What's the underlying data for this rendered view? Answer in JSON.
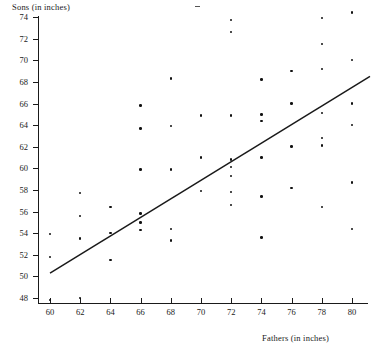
{
  "chart_data": {
    "type": "scatter",
    "title": "",
    "xlabel": "Fathers (in inches)",
    "ylabel": "Sons (in inches)",
    "xlim": [
      58.8,
      81.5
    ],
    "ylim": [
      46.6,
      74.8
    ],
    "xticks": [
      60,
      62,
      64,
      66,
      68,
      70,
      72,
      74,
      76,
      78,
      80
    ],
    "yticks": [
      48,
      50,
      52,
      54,
      56,
      58,
      60,
      62,
      64,
      66,
      68,
      70,
      72,
      74
    ],
    "grid": false,
    "legend": "none",
    "marker_color": "#111111",
    "line_color": "#1a1a1a",
    "trendline": {
      "label": "least-squares regression line",
      "x_start": 60.0,
      "y_start": 50.3,
      "x_end": 80.0,
      "y_end": 68.5
    },
    "points": [
      {
        "x": 60,
        "y": 47.8
      },
      {
        "x": 60,
        "y": 51.8
      },
      {
        "x": 60,
        "y": 53.9
      },
      {
        "x": 62,
        "y": 48.0
      },
      {
        "x": 62,
        "y": 53.5
      },
      {
        "x": 62,
        "y": 55.6
      },
      {
        "x": 62,
        "y": 57.7
      },
      {
        "x": 64,
        "y": 51.5
      },
      {
        "x": 64,
        "y": 54.0
      },
      {
        "x": 64,
        "y": 56.4
      },
      {
        "x": 66,
        "y": 54.3
      },
      {
        "x": 66,
        "y": 55.0
      },
      {
        "x": 66,
        "y": 55.8
      },
      {
        "x": 66,
        "y": 59.9
      },
      {
        "x": 66,
        "y": 63.7
      },
      {
        "x": 66,
        "y": 65.8
      },
      {
        "x": 68,
        "y": 53.3
      },
      {
        "x": 68,
        "y": 54.4
      },
      {
        "x": 68,
        "y": 59.9
      },
      {
        "x": 68,
        "y": 63.9
      },
      {
        "x": 68,
        "y": 68.3
      },
      {
        "x": 70,
        "y": 57.9
      },
      {
        "x": 70,
        "y": 61.0
      },
      {
        "x": 70,
        "y": 64.9
      },
      {
        "x": 72,
        "y": 56.6
      },
      {
        "x": 72,
        "y": 57.8
      },
      {
        "x": 72,
        "y": 59.3
      },
      {
        "x": 72,
        "y": 60.1
      },
      {
        "x": 72,
        "y": 60.8
      },
      {
        "x": 72,
        "y": 64.9
      },
      {
        "x": 72,
        "y": 72.6
      },
      {
        "x": 72,
        "y": 73.7
      },
      {
        "x": 74,
        "y": 53.6
      },
      {
        "x": 74,
        "y": 57.4
      },
      {
        "x": 74,
        "y": 61.0
      },
      {
        "x": 74,
        "y": 64.4
      },
      {
        "x": 74,
        "y": 65.0
      },
      {
        "x": 74,
        "y": 68.2
      },
      {
        "x": 76,
        "y": 58.2
      },
      {
        "x": 76,
        "y": 62.0
      },
      {
        "x": 76,
        "y": 66.0
      },
      {
        "x": 76,
        "y": 69.0
      },
      {
        "x": 78,
        "y": 56.4
      },
      {
        "x": 78,
        "y": 62.1
      },
      {
        "x": 78,
        "y": 62.8
      },
      {
        "x": 78,
        "y": 65.1
      },
      {
        "x": 78,
        "y": 69.2
      },
      {
        "x": 78,
        "y": 71.5
      },
      {
        "x": 78,
        "y": 73.9
      },
      {
        "x": 80,
        "y": 54.4
      },
      {
        "x": 80,
        "y": 58.7
      },
      {
        "x": 80,
        "y": 64.0
      },
      {
        "x": 80,
        "y": 66.0
      },
      {
        "x": 80,
        "y": 70.0
      },
      {
        "x": 80,
        "y": 74.4
      }
    ]
  }
}
